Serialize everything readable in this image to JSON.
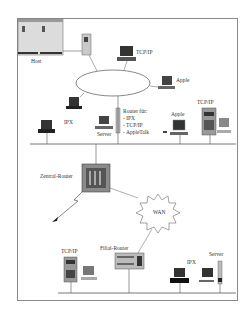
{
  "diagram": {
    "type": "network-topology",
    "labels": {
      "host": "Host",
      "tcpip_top": "TCP/IP",
      "apple_ring": "Apple",
      "ipx_left": "IPX",
      "server_mid": "Server",
      "router_title": "Router für:",
      "router_ipx": "- IPX",
      "router_tcpip": "- TCP/IP",
      "router_appletalk": "- AppleTalk",
      "apple_lan": "Apple",
      "tcpip_right": "TCP/IP",
      "central_router": "Zentral-Router",
      "wan": "WAN",
      "tcpip_bottom": "TCP/IP",
      "branch_router": "Filial-Router",
      "ipx_bottom": "IPX",
      "server_bottom": "Server"
    },
    "segments": [
      "Token Ring / Host network",
      "Backbone LAN",
      "WAN",
      "Branch LAN"
    ]
  }
}
